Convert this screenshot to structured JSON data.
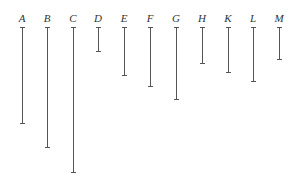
{
  "diagram": {
    "top_y": 27,
    "label_y": 13,
    "segments": [
      {
        "label": "A",
        "x": 22,
        "bottom": 123
      },
      {
        "label": "B",
        "x": 47,
        "bottom": 147
      },
      {
        "label": "C",
        "x": 73,
        "bottom": 172
      },
      {
        "label": "D",
        "x": 98,
        "bottom": 51
      },
      {
        "label": "E",
        "x": 124,
        "bottom": 75
      },
      {
        "label": "F",
        "x": 150,
        "bottom": 86
      },
      {
        "label": "G",
        "x": 176,
        "bottom": 99
      },
      {
        "label": "H",
        "x": 202,
        "bottom": 63
      },
      {
        "label": "K",
        "x": 228,
        "bottom": 72
      },
      {
        "label": "L",
        "x": 253,
        "bottom": 81
      },
      {
        "label": "M",
        "x": 279,
        "bottom": 59
      }
    ]
  }
}
